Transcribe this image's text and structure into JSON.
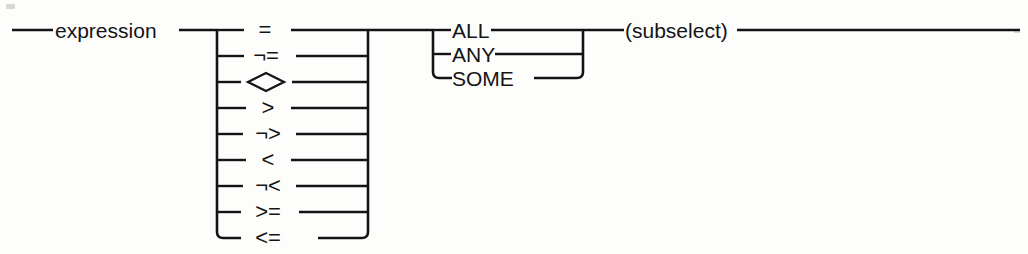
{
  "diagram": {
    "kind": "railroad-syntax-diagram",
    "line_color": "#141414",
    "background_color": "#fdfdfc",
    "entry": {
      "label": "expression",
      "name": "expression-term"
    },
    "operators": {
      "name": "comparison-operator-choice",
      "items": [
        {
          "label": "=",
          "name": "operator-equal"
        },
        {
          "label": "¬=",
          "name": "operator-not-equal"
        },
        {
          "label": "<>",
          "name": "operator-diamond-not-equal",
          "render": "diamond"
        },
        {
          "label": ">",
          "name": "operator-greater-than"
        },
        {
          "label": "¬>",
          "name": "operator-not-greater-than"
        },
        {
          "label": "<",
          "name": "operator-less-than"
        },
        {
          "label": "¬<",
          "name": "operator-not-less-than"
        },
        {
          "label": ">=",
          "name": "operator-greater-or-equal"
        },
        {
          "label": "<=",
          "name": "operator-less-or-equal"
        }
      ]
    },
    "quantifiers": {
      "name": "quantifier-choice",
      "items": [
        {
          "label": "ALL",
          "name": "quantifier-all"
        },
        {
          "label": "ANY",
          "name": "quantifier-any"
        },
        {
          "label": "SOME",
          "name": "quantifier-some"
        }
      ]
    },
    "subselect": {
      "label": "(subselect)",
      "name": "subselect-term"
    }
  }
}
